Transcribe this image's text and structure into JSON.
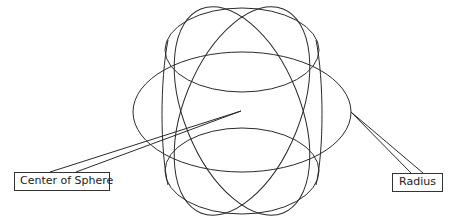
{
  "diagram": {
    "labels": {
      "center": "Center of Sphere",
      "radius": "Radius"
    },
    "colors": {
      "stroke": "#2a2a2a",
      "background": "#ffffff"
    }
  }
}
